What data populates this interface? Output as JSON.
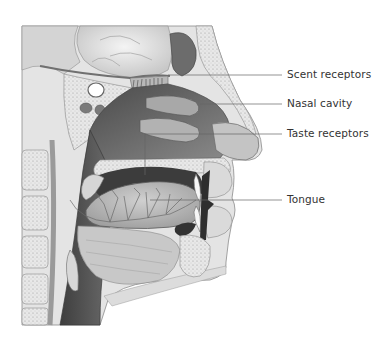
{
  "diagram": {
    "style": "grayscale pencil illustration",
    "colors": {
      "background": "#ffffff",
      "label_text": "#333333",
      "leader_line": "#666666",
      "cavity_dark": "#5a5a5a",
      "tissue_light": "#d8d8d8",
      "bone_light": "#e6e6e6",
      "tongue_mid": "#b4b4b4"
    },
    "labels": [
      {
        "id": "scent-receptors",
        "text": "Scent receptors",
        "x": 287,
        "y": 68
      },
      {
        "id": "nasal-cavity",
        "text": "Nasal cavity",
        "x": 287,
        "y": 97
      },
      {
        "id": "taste-receptors",
        "text": "Taste receptors",
        "x": 287,
        "y": 127
      },
      {
        "id": "tongue",
        "text": "Tongue",
        "x": 287,
        "y": 193
      }
    ]
  }
}
